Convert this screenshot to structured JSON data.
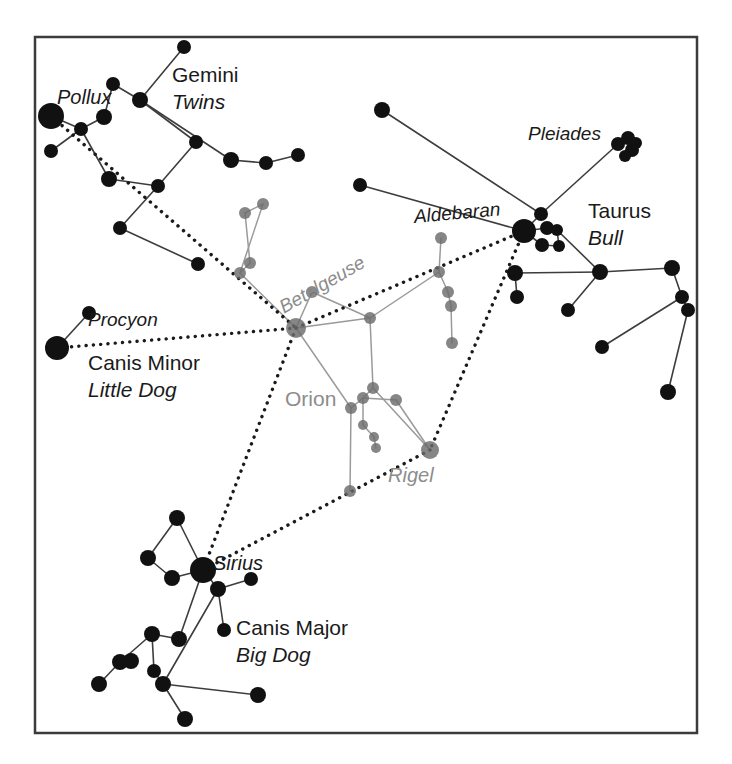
{
  "figure": {
    "border_color": "#3b3b3b",
    "background": "#ffffff",
    "frame": {
      "x": 35,
      "y": 37,
      "width": 662,
      "height": 696
    }
  },
  "colors": {
    "star_bright": "#111111",
    "star_dim": "#6b6b6b",
    "line_dark": "#3d3d3d",
    "line_dim": "#9a9a9a",
    "dashed_line": "#1a1a1a",
    "label_dark": "#1a1a1a",
    "label_gray": "#8c8c8c",
    "border": "#3b3b3b"
  },
  "labels": [
    {
      "id": "pollux",
      "text": "Pollux",
      "x": 57,
      "y": 87,
      "size": 20,
      "style": "italic",
      "tone": "dark",
      "rotate": 0
    },
    {
      "id": "gemini",
      "text": "Gemini",
      "x": 172,
      "y": 64,
      "size": 21,
      "style": "normal",
      "tone": "dark",
      "rotate": 0
    },
    {
      "id": "twins",
      "text": "Twins",
      "x": 172,
      "y": 91,
      "size": 21,
      "style": "italic",
      "tone": "dark",
      "rotate": 0
    },
    {
      "id": "pleiades",
      "text": "Pleiades",
      "x": 528,
      "y": 124,
      "size": 19,
      "style": "italic",
      "tone": "dark",
      "rotate": 0
    },
    {
      "id": "aldebaran",
      "text": "Aldebaran",
      "x": 413,
      "y": 207,
      "size": 19,
      "style": "italic",
      "tone": "dark",
      "rotate": -5
    },
    {
      "id": "taurus",
      "text": "Taurus",
      "x": 588,
      "y": 200,
      "size": 21,
      "style": "normal",
      "tone": "dark",
      "rotate": 0
    },
    {
      "id": "bull",
      "text": "Bull",
      "x": 588,
      "y": 227,
      "size": 21,
      "style": "italic",
      "tone": "dark",
      "rotate": 0
    },
    {
      "id": "betelgeuse",
      "text": "Betelgeuse",
      "x": 276,
      "y": 300,
      "size": 19,
      "style": "italic",
      "tone": "gray",
      "rotate": -30
    },
    {
      "id": "procyon",
      "text": "Procyon",
      "x": 88,
      "y": 310,
      "size": 19,
      "style": "italic",
      "tone": "dark",
      "rotate": 0
    },
    {
      "id": "canis-minor",
      "text": "Canis Minor",
      "x": 88,
      "y": 352,
      "size": 21,
      "style": "normal",
      "tone": "dark",
      "rotate": 0
    },
    {
      "id": "little-dog",
      "text": "Little Dog",
      "x": 88,
      "y": 379,
      "size": 21,
      "style": "italic",
      "tone": "dark",
      "rotate": 0
    },
    {
      "id": "orion",
      "text": "Orion",
      "x": 285,
      "y": 388,
      "size": 21,
      "style": "normal",
      "tone": "gray",
      "rotate": 0
    },
    {
      "id": "rigel",
      "text": "Rigel",
      "x": 388,
      "y": 465,
      "size": 20,
      "style": "italic",
      "tone": "gray",
      "rotate": 0
    },
    {
      "id": "sirius",
      "text": "Sirius",
      "x": 213,
      "y": 553,
      "size": 20,
      "style": "italic",
      "tone": "dark",
      "rotate": 0
    },
    {
      "id": "canis-major",
      "text": "Canis Major",
      "x": 236,
      "y": 617,
      "size": 21,
      "style": "normal",
      "tone": "dark",
      "rotate": 0
    },
    {
      "id": "big-dog",
      "text": "Big Dog",
      "x": 236,
      "y": 644,
      "size": 21,
      "style": "italic",
      "tone": "dark",
      "rotate": 0
    }
  ],
  "chart_data": {
    "type": "scatter",
    "xlabel": "",
    "ylabel": "",
    "grid": false,
    "legend": "none",
    "xlim": [
      35,
      697
    ],
    "ylim": [
      37,
      733
    ],
    "constellations": [
      "Gemini (Twins)",
      "Taurus (Bull)",
      "Orion",
      "Canis Major (Big Dog)",
      "Canis Minor (Little Dog)",
      "Pleiades"
    ],
    "named_stars": [
      {
        "name": "Pollux",
        "x": 51,
        "y": 116,
        "magnitude_px": 13,
        "tone": "bright"
      },
      {
        "name": "Procyon",
        "x": 57,
        "y": 348,
        "magnitude_px": 12,
        "tone": "bright"
      },
      {
        "name": "Sirius",
        "x": 203,
        "y": 570,
        "magnitude_px": 13,
        "tone": "bright"
      },
      {
        "name": "Aldebaran",
        "x": 524,
        "y": 231,
        "magnitude_px": 12,
        "tone": "bright"
      },
      {
        "name": "Betelgeuse",
        "x": 296,
        "y": 328,
        "magnitude_px": 10,
        "tone": "dim"
      },
      {
        "name": "Rigel",
        "x": 430,
        "y": 450,
        "magnitude_px": 9,
        "tone": "dim"
      }
    ],
    "stars": [
      {
        "id": "g1",
        "x": 51,
        "y": 116,
        "r": 13,
        "tone": "bright"
      },
      {
        "id": "g2",
        "x": 81,
        "y": 129,
        "r": 7,
        "tone": "bright"
      },
      {
        "id": "g3",
        "x": 51,
        "y": 151,
        "r": 7,
        "tone": "bright"
      },
      {
        "id": "g4",
        "x": 104,
        "y": 117,
        "r": 8,
        "tone": "bright"
      },
      {
        "id": "g5",
        "x": 113,
        "y": 84,
        "r": 7,
        "tone": "bright"
      },
      {
        "id": "g6",
        "x": 140,
        "y": 100,
        "r": 8,
        "tone": "bright"
      },
      {
        "id": "g7",
        "x": 184,
        "y": 47,
        "r": 7,
        "tone": "bright"
      },
      {
        "id": "g8",
        "x": 196,
        "y": 142,
        "r": 7,
        "tone": "bright"
      },
      {
        "id": "g9",
        "x": 109,
        "y": 179,
        "r": 8,
        "tone": "bright"
      },
      {
        "id": "g10",
        "x": 158,
        "y": 186,
        "r": 7,
        "tone": "bright"
      },
      {
        "id": "g11",
        "x": 120,
        "y": 228,
        "r": 7,
        "tone": "bright"
      },
      {
        "id": "g12",
        "x": 198,
        "y": 264,
        "r": 7,
        "tone": "bright"
      },
      {
        "id": "g13",
        "x": 231,
        "y": 160,
        "r": 8,
        "tone": "bright"
      },
      {
        "id": "g14",
        "x": 266,
        "y": 163,
        "r": 7,
        "tone": "bright"
      },
      {
        "id": "g15",
        "x": 298,
        "y": 155,
        "r": 7,
        "tone": "bright"
      },
      {
        "id": "o1",
        "x": 296,
        "y": 328,
        "r": 10,
        "tone": "dim"
      },
      {
        "id": "o2",
        "x": 312,
        "y": 292,
        "r": 6,
        "tone": "dim"
      },
      {
        "id": "o3",
        "x": 370,
        "y": 318,
        "r": 6,
        "tone": "dim"
      },
      {
        "id": "o4",
        "x": 373,
        "y": 388,
        "r": 6,
        "tone": "dim"
      },
      {
        "id": "o5",
        "x": 363,
        "y": 398,
        "r": 6,
        "tone": "dim"
      },
      {
        "id": "o6",
        "x": 351,
        "y": 408,
        "r": 6,
        "tone": "dim"
      },
      {
        "id": "o7",
        "x": 363,
        "y": 425,
        "r": 5,
        "tone": "dim"
      },
      {
        "id": "o8",
        "x": 374,
        "y": 437,
        "r": 5,
        "tone": "dim"
      },
      {
        "id": "o9",
        "x": 376,
        "y": 448,
        "r": 5,
        "tone": "dim"
      },
      {
        "id": "o10",
        "x": 350,
        "y": 491,
        "r": 6,
        "tone": "dim"
      },
      {
        "id": "o11",
        "x": 396,
        "y": 400,
        "r": 6,
        "tone": "dim"
      },
      {
        "id": "o12",
        "x": 430,
        "y": 450,
        "r": 9,
        "tone": "dim"
      },
      {
        "id": "o13",
        "x": 439,
        "y": 272,
        "r": 6,
        "tone": "dim"
      },
      {
        "id": "o14",
        "x": 441,
        "y": 238,
        "r": 6,
        "tone": "dim"
      },
      {
        "id": "o15",
        "x": 448,
        "y": 292,
        "r": 6,
        "tone": "dim"
      },
      {
        "id": "o16",
        "x": 451,
        "y": 306,
        "r": 6,
        "tone": "dim"
      },
      {
        "id": "o17",
        "x": 452,
        "y": 343,
        "r": 6,
        "tone": "dim"
      },
      {
        "id": "o18",
        "x": 245,
        "y": 213,
        "r": 6,
        "tone": "dim"
      },
      {
        "id": "o19",
        "x": 263,
        "y": 204,
        "r": 6,
        "tone": "dim"
      },
      {
        "id": "o20",
        "x": 250,
        "y": 263,
        "r": 6,
        "tone": "dim"
      },
      {
        "id": "o21",
        "x": 240,
        "y": 273,
        "r": 6,
        "tone": "dim"
      },
      {
        "id": "t1",
        "x": 524,
        "y": 231,
        "r": 12,
        "tone": "bright"
      },
      {
        "id": "t2",
        "x": 541,
        "y": 214,
        "r": 7,
        "tone": "bright"
      },
      {
        "id": "t3",
        "x": 547,
        "y": 228,
        "r": 7,
        "tone": "bright"
      },
      {
        "id": "t4",
        "x": 557,
        "y": 230,
        "r": 6,
        "tone": "bright"
      },
      {
        "id": "t5",
        "x": 542,
        "y": 245,
        "r": 7,
        "tone": "bright"
      },
      {
        "id": "t6",
        "x": 559,
        "y": 246,
        "r": 6,
        "tone": "bright"
      },
      {
        "id": "t7",
        "x": 382,
        "y": 110,
        "r": 8,
        "tone": "bright"
      },
      {
        "id": "t8",
        "x": 360,
        "y": 185,
        "r": 7,
        "tone": "bright"
      },
      {
        "id": "t9",
        "x": 600,
        "y": 272,
        "r": 8,
        "tone": "bright"
      },
      {
        "id": "t10",
        "x": 515,
        "y": 273,
        "r": 8,
        "tone": "bright"
      },
      {
        "id": "t11",
        "x": 517,
        "y": 297,
        "r": 7,
        "tone": "bright"
      },
      {
        "id": "t12",
        "x": 568,
        "y": 310,
        "r": 7,
        "tone": "bright"
      },
      {
        "id": "t13",
        "x": 672,
        "y": 268,
        "r": 8,
        "tone": "bright"
      },
      {
        "id": "t14",
        "x": 682,
        "y": 297,
        "r": 7,
        "tone": "bright"
      },
      {
        "id": "t15",
        "x": 688,
        "y": 310,
        "r": 7,
        "tone": "bright"
      },
      {
        "id": "t16",
        "x": 602,
        "y": 347,
        "r": 7,
        "tone": "bright"
      },
      {
        "id": "t17",
        "x": 668,
        "y": 392,
        "r": 8,
        "tone": "bright"
      },
      {
        "id": "p1",
        "x": 618,
        "y": 144,
        "r": 7,
        "tone": "bright"
      },
      {
        "id": "p2",
        "x": 628,
        "y": 138,
        "r": 7,
        "tone": "bright"
      },
      {
        "id": "p3",
        "x": 632,
        "y": 150,
        "r": 7,
        "tone": "bright"
      },
      {
        "id": "p4",
        "x": 625,
        "y": 156,
        "r": 6,
        "tone": "bright"
      },
      {
        "id": "p5",
        "x": 636,
        "y": 143,
        "r": 6,
        "tone": "bright"
      },
      {
        "id": "cmi1",
        "x": 57,
        "y": 348,
        "r": 12,
        "tone": "bright"
      },
      {
        "id": "cmi2",
        "x": 89,
        "y": 313,
        "r": 7,
        "tone": "bright"
      },
      {
        "id": "s1",
        "x": 203,
        "y": 570,
        "r": 13,
        "tone": "bright"
      },
      {
        "id": "s2",
        "x": 177,
        "y": 518,
        "r": 8,
        "tone": "bright"
      },
      {
        "id": "s3",
        "x": 148,
        "y": 558,
        "r": 8,
        "tone": "bright"
      },
      {
        "id": "s4",
        "x": 172,
        "y": 578,
        "r": 8,
        "tone": "bright"
      },
      {
        "id": "s5",
        "x": 218,
        "y": 589,
        "r": 8,
        "tone": "bright"
      },
      {
        "id": "s6",
        "x": 251,
        "y": 579,
        "r": 7,
        "tone": "bright"
      },
      {
        "id": "s7",
        "x": 224,
        "y": 630,
        "r": 7,
        "tone": "bright"
      },
      {
        "id": "s8",
        "x": 152,
        "y": 634,
        "r": 8,
        "tone": "bright"
      },
      {
        "id": "s9",
        "x": 179,
        "y": 639,
        "r": 8,
        "tone": "bright"
      },
      {
        "id": "s10",
        "x": 131,
        "y": 661,
        "r": 8,
        "tone": "bright"
      },
      {
        "id": "s11",
        "x": 120,
        "y": 662,
        "r": 8,
        "tone": "bright"
      },
      {
        "id": "s12",
        "x": 99,
        "y": 684,
        "r": 8,
        "tone": "bright"
      },
      {
        "id": "s13",
        "x": 154,
        "y": 671,
        "r": 7,
        "tone": "bright"
      },
      {
        "id": "s14",
        "x": 163,
        "y": 684,
        "r": 8,
        "tone": "bright"
      },
      {
        "id": "s15",
        "x": 258,
        "y": 695,
        "r": 8,
        "tone": "bright"
      },
      {
        "id": "s16",
        "x": 185,
        "y": 719,
        "r": 8,
        "tone": "bright"
      }
    ],
    "links_dark": [
      [
        "g1",
        "g2"
      ],
      [
        "g2",
        "g3"
      ],
      [
        "g2",
        "g4"
      ],
      [
        "g4",
        "g5"
      ],
      [
        "g5",
        "g6"
      ],
      [
        "g6",
        "g7"
      ],
      [
        "g6",
        "g13"
      ],
      [
        "g13",
        "g14"
      ],
      [
        "g14",
        "g15"
      ],
      [
        "g6",
        "g8"
      ],
      [
        "g2",
        "g9"
      ],
      [
        "g9",
        "g10"
      ],
      [
        "g10",
        "g11"
      ],
      [
        "g11",
        "g12"
      ],
      [
        "g10",
        "g8"
      ],
      [
        "t7",
        "t2"
      ],
      [
        "t2",
        "t1"
      ],
      [
        "t2",
        "p1"
      ],
      [
        "t1",
        "t3"
      ],
      [
        "t3",
        "t4"
      ],
      [
        "t1",
        "t5"
      ],
      [
        "t5",
        "t6"
      ],
      [
        "t4",
        "t6"
      ],
      [
        "t1",
        "t8"
      ],
      [
        "t4",
        "t9"
      ],
      [
        "t9",
        "t10"
      ],
      [
        "t10",
        "t11"
      ],
      [
        "t9",
        "t12"
      ],
      [
        "t9",
        "t13"
      ],
      [
        "t13",
        "t14"
      ],
      [
        "t14",
        "t15"
      ],
      [
        "t14",
        "t16"
      ],
      [
        "t15",
        "t17"
      ],
      [
        "cmi1",
        "cmi2"
      ],
      [
        "s1",
        "s2"
      ],
      [
        "s2",
        "s3"
      ],
      [
        "s3",
        "s4"
      ],
      [
        "s4",
        "s1"
      ],
      [
        "s1",
        "s5"
      ],
      [
        "s5",
        "s6"
      ],
      [
        "s5",
        "s7"
      ],
      [
        "s1",
        "s9"
      ],
      [
        "s5",
        "s14"
      ],
      [
        "s9",
        "s8"
      ],
      [
        "s8",
        "s11"
      ],
      [
        "s11",
        "s12"
      ],
      [
        "s8",
        "s13"
      ],
      [
        "s13",
        "s14"
      ],
      [
        "s14",
        "s15"
      ],
      [
        "s14",
        "s16"
      ]
    ],
    "links_dim": [
      [
        "o1",
        "o2"
      ],
      [
        "o2",
        "o3"
      ],
      [
        "o1",
        "o3"
      ],
      [
        "o3",
        "o4"
      ],
      [
        "o4",
        "o5"
      ],
      [
        "o5",
        "o6"
      ],
      [
        "o6",
        "o10"
      ],
      [
        "o5",
        "o7"
      ],
      [
        "o7",
        "o8"
      ],
      [
        "o8",
        "o9"
      ],
      [
        "o5",
        "o11"
      ],
      [
        "o11",
        "o12"
      ],
      [
        "o4",
        "o12"
      ],
      [
        "o3",
        "o13"
      ],
      [
        "o13",
        "o14"
      ],
      [
        "o13",
        "o15"
      ],
      [
        "o15",
        "o16"
      ],
      [
        "o16",
        "o17"
      ],
      [
        "o1",
        "o21"
      ],
      [
        "o21",
        "o20"
      ],
      [
        "o20",
        "o18"
      ],
      [
        "o18",
        "o19"
      ],
      [
        "o19",
        "o21"
      ],
      [
        "o1",
        "o6"
      ]
    ],
    "pointer_lines": [
      {
        "from": "Pollux",
        "to": "Betelgeuse",
        "style": "dashed"
      },
      {
        "from": "Procyon",
        "to": "Betelgeuse",
        "style": "dashed"
      },
      {
        "from": "Betelgeuse",
        "to": "Aldebaran",
        "style": "dashed"
      },
      {
        "from": "Aldebaran",
        "to": "Rigel",
        "style": "dashed"
      },
      {
        "from": "Betelgeuse",
        "to": "Sirius",
        "style": "dashed"
      },
      {
        "from": "Rigel",
        "to": "Sirius",
        "style": "dashed"
      }
    ]
  }
}
